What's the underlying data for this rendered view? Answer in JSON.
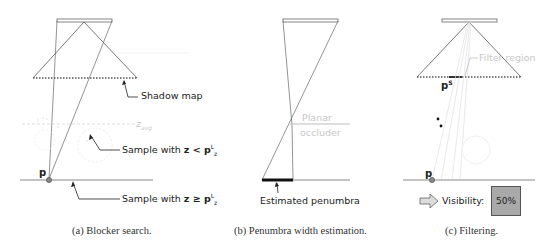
{
  "panels": [
    {
      "id": "a",
      "caption": "(a) Blocker search.",
      "labels": {
        "shadow_map": "Shadow map",
        "sample_less_prefix": "Sample with ",
        "sample_less_math": "z < p",
        "sample_less_sup": "L",
        "sample_less_sub": "z",
        "sample_geq_prefix": "Sample with ",
        "sample_geq_math": "z ≥ p",
        "sample_geq_sup": "L",
        "sample_geq_sub": "z",
        "z_avg": "z",
        "z_avg_sub": "avg",
        "point": "p"
      }
    },
    {
      "id": "b",
      "caption": "(b) Penumbra width estimation.",
      "labels": {
        "planar_occluder_line1": "Planar",
        "planar_occluder_line2": "occluder",
        "estimated_penumbra": "Estimated penumbra"
      }
    },
    {
      "id": "c",
      "caption": "(c) Filtering.",
      "labels": {
        "filter_region": "Filter region",
        "point_s": "p",
        "point_s_sup": "S",
        "point": "p",
        "visibility": "Visibility:",
        "visibility_value": "50%"
      }
    }
  ],
  "colors": {
    "line": "#555555",
    "faint": "#d0d0d0",
    "ground": "#c0c0c0",
    "penumbra": "#111111",
    "visibility_box": "#a9a9a9"
  }
}
